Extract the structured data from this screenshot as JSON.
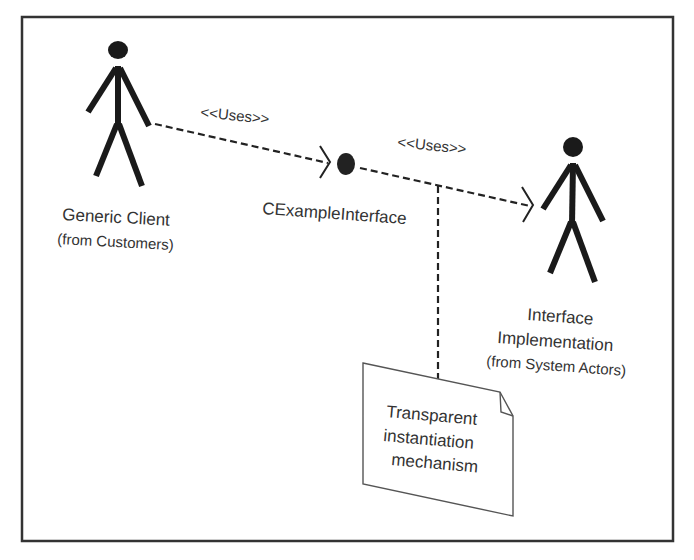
{
  "diagram": {
    "type": "UML use-case / interface diagram",
    "colors": {
      "ink": "#222222",
      "text": "#333333",
      "background": "#ffffff",
      "frame": "#333333"
    },
    "actors": [
      {
        "id": "generic-client",
        "name": "Generic Client",
        "package": "(from Customers)"
      },
      {
        "id": "interface-implementation",
        "name_line1": "Interface",
        "name_line2": "Implementation",
        "package": "(from System Actors)"
      }
    ],
    "interface": {
      "name": "CExampleInterface",
      "icon": "lollipop-circle"
    },
    "relations": [
      {
        "from": "generic-client",
        "to": "CExampleInterface",
        "stereotype": "<<Uses>>",
        "style": "dashed-open-arrow"
      },
      {
        "from": "CExampleInterface",
        "to": "interface-implementation",
        "stereotype": "<<Uses>>",
        "style": "dashed-open-arrow"
      }
    ],
    "note": {
      "lines": [
        "Transparent",
        "instantiation",
        "mechanism"
      ],
      "attached_to": "relation-2"
    }
  }
}
